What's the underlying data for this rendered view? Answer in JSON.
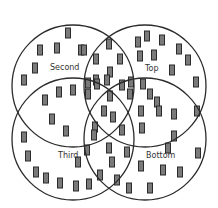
{
  "diagram": {
    "type": "venn",
    "sets": [
      {
        "name": "Second",
        "cx": 73,
        "cy": 86,
        "r": 61,
        "label_x": 50,
        "label_y": 70
      },
      {
        "name": "Top",
        "cx": 145,
        "cy": 86,
        "r": 61,
        "label_x": 145,
        "label_y": 71
      },
      {
        "name": "Third",
        "cx": 73,
        "cy": 139,
        "r": 61,
        "label_x": 58,
        "label_y": 158
      },
      {
        "name": "Bottom",
        "cx": 145,
        "cy": 139,
        "r": 61,
        "label_x": 146,
        "label_y": 158
      }
    ],
    "labels": {
      "second": "Second",
      "top": "Top",
      "third": "Third",
      "bottom": "Bottom"
    },
    "items": [
      [
        68,
        33
      ],
      [
        40,
        50
      ],
      [
        57,
        48
      ],
      [
        81,
        50
      ],
      [
        35,
        68
      ],
      [
        24,
        80
      ],
      [
        84,
        50
      ],
      [
        109,
        44
      ],
      [
        96,
        59
      ],
      [
        120,
        59
      ],
      [
        110,
        72
      ],
      [
        96,
        80
      ],
      [
        107,
        80
      ],
      [
        138,
        42
      ],
      [
        147,
        36
      ],
      [
        162,
        40
      ],
      [
        154,
        55
      ],
      [
        140,
        56
      ],
      [
        179,
        49
      ],
      [
        188,
        60
      ],
      [
        172,
        70
      ],
      [
        196,
        82
      ],
      [
        88,
        83
      ],
      [
        97,
        84
      ],
      [
        88,
        94
      ],
      [
        110,
        96
      ],
      [
        122,
        85
      ],
      [
        131,
        82
      ],
      [
        130,
        94
      ],
      [
        59,
        92
      ],
      [
        73,
        90
      ],
      [
        45,
        100
      ],
      [
        52,
        119
      ],
      [
        66,
        131
      ],
      [
        104,
        111
      ],
      [
        113,
        117
      ],
      [
        95,
        127
      ],
      [
        122,
        130
      ],
      [
        94,
        135
      ],
      [
        143,
        84
      ],
      [
        150,
        94
      ],
      [
        157,
        102
      ],
      [
        141,
        111
      ],
      [
        159,
        111
      ],
      [
        174,
        114
      ],
      [
        174,
        136
      ],
      [
        168,
        148
      ],
      [
        142,
        128
      ],
      [
        24,
        137
      ],
      [
        28,
        156
      ],
      [
        36,
        172
      ],
      [
        46,
        178
      ],
      [
        60,
        183
      ],
      [
        76,
        186
      ],
      [
        89,
        184
      ],
      [
        78,
        162
      ],
      [
        87,
        150
      ],
      [
        109,
        148
      ],
      [
        127,
        152
      ],
      [
        100,
        175
      ],
      [
        112,
        162
      ],
      [
        117,
        180
      ],
      [
        141,
        166
      ],
      [
        163,
        170
      ],
      [
        180,
        172
      ],
      [
        150,
        188
      ],
      [
        129,
        188
      ],
      [
        197,
        111
      ],
      [
        198,
        153
      ]
    ]
  }
}
